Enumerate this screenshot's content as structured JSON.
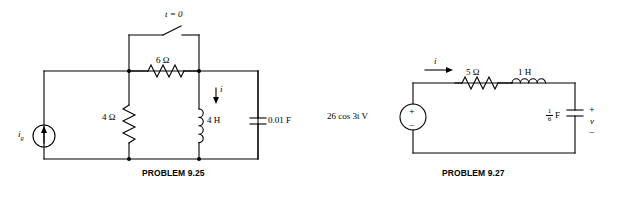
{
  "page": {
    "background": "#ffffff",
    "ink": "#000000"
  },
  "circuits": [
    {
      "id": "problem-9-25",
      "caption": "PROBLEM 9.25",
      "labels": {
        "switch_time": "t = 0",
        "resistor_top": "6 Ω",
        "resistor_left": "4 Ω",
        "inductor": "4 H",
        "capacitor": "0.01 F",
        "source": "i",
        "source_sub": "g",
        "branch_current": "i"
      }
    },
    {
      "id": "problem-9-27",
      "caption": "PROBLEM 9.27",
      "labels": {
        "mesh_current": "i",
        "resistor": "5 Ω",
        "inductor": "1 H",
        "source": "26 cos 3t V",
        "capacitor_num": "1",
        "capacitor_den": "6",
        "capacitor_unit": "F",
        "voltage": "v",
        "polarity_plus": "+",
        "polarity_minus": "−"
      }
    }
  ]
}
